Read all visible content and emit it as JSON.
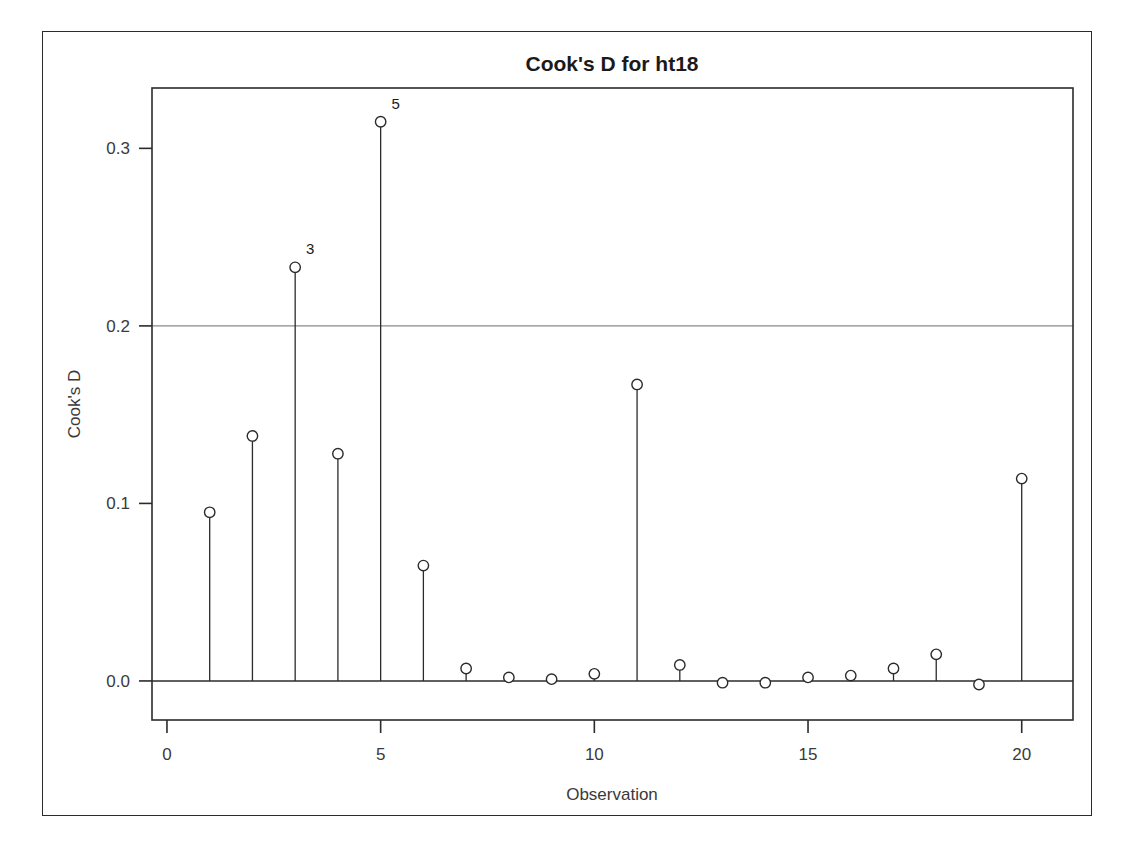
{
  "chart_data": {
    "type": "scatter",
    "title": "Cook's D for ht18",
    "xlabel": "Observation",
    "ylabel": "Cook's D",
    "x": [
      1,
      2,
      3,
      4,
      5,
      6,
      7,
      8,
      9,
      10,
      11,
      12,
      13,
      14,
      15,
      16,
      17,
      18,
      19,
      20
    ],
    "values": [
      0.095,
      0.138,
      0.233,
      0.128,
      0.315,
      0.065,
      0.007,
      0.002,
      0.001,
      0.004,
      0.167,
      0.009,
      -0.001,
      -0.001,
      0.002,
      0.003,
      0.007,
      0.015,
      -0.002,
      0.114
    ],
    "point_labels": [
      {
        "x": 3,
        "y": 0.233,
        "text": "3"
      },
      {
        "x": 5,
        "y": 0.315,
        "text": "5"
      }
    ],
    "xticks": [
      0,
      5,
      10,
      15,
      20
    ],
    "xtick_labels": [
      "0",
      "5",
      "10",
      "15",
      "20"
    ],
    "yticks": [
      0.0,
      0.1,
      0.2,
      0.3
    ],
    "ytick_labels": [
      "0.0",
      "0.1",
      "0.2",
      "0.3"
    ],
    "xlim": [
      -0.35,
      21.2
    ],
    "ylim": [
      -0.022,
      0.334
    ],
    "reference_lines": [
      {
        "axis": "y",
        "value": 0.2,
        "color": "#8a8a8a"
      }
    ],
    "baseline": 0.0,
    "grid": false,
    "legend": false,
    "marker": "open-circle",
    "colors": {
      "stem": "#2b2b2b",
      "marker_fill": "#ffffff",
      "marker_stroke": "#2b2b2b",
      "reference_line": "#8a8a8a",
      "axis": "#2b2b2b",
      "background": "#ffffff"
    }
  }
}
